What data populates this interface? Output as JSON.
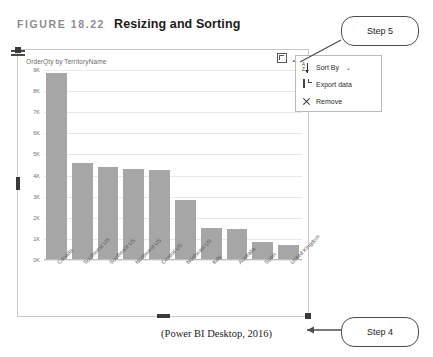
{
  "figure": {
    "label": "FIGURE 18.22",
    "title": "Resizing and Sorting",
    "caption": "(Power BI Desktop, 2016)"
  },
  "visual": {
    "tools": [
      {
        "name": "focus-mode-icon",
        "label": "Focus mode"
      },
      {
        "name": "more-options-icon",
        "label": "..."
      }
    ]
  },
  "context_menu": {
    "items": [
      {
        "label": "Sort By",
        "icon": "sort-az-icon",
        "chevron": "⌄"
      },
      {
        "label": "Export data",
        "icon": "file-icon",
        "chevron": ""
      },
      {
        "label": "Remove",
        "icon": "close-x-icon",
        "chevron": ""
      }
    ]
  },
  "callouts": [
    {
      "name": "step-5",
      "label": "Step 5"
    },
    {
      "name": "step-4",
      "label": "Step 4"
    }
  ],
  "colors": {
    "bar": "#a6a6a6",
    "gridline": "#e8e8e8",
    "frame": "#c9c9c9",
    "handle": "#3a3a3a"
  },
  "chart_data": {
    "type": "bar",
    "title": "OrderQty by TerritoryName",
    "xlabel": "TerritoryName",
    "ylabel": "OrderQty",
    "categories": [
      "Canada",
      "Southwest US",
      "Southeast US",
      "Northwest US",
      "Central US",
      "Northeast US",
      "Italy",
      "Australia",
      "Spain",
      "United Kingdom"
    ],
    "values": [
      8850,
      4600,
      4400,
      4320,
      4250,
      2850,
      1520,
      1480,
      850,
      700
    ],
    "ylim": [
      0,
      9000
    ],
    "yticks": [
      0,
      1000,
      2000,
      3000,
      4000,
      5000,
      6000,
      7000,
      8000,
      9000
    ],
    "ytick_labels": [
      "0K",
      "1K",
      "2K",
      "3K",
      "4K",
      "5K",
      "6K",
      "7K",
      "8K",
      "9K"
    ],
    "grid": true,
    "legend": false
  }
}
